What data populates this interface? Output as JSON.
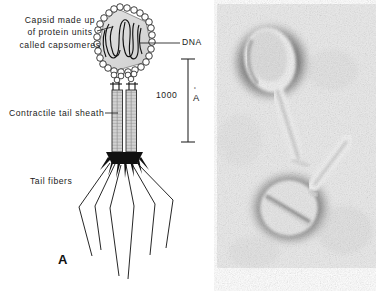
{
  "figure": {
    "background_color": "#ffffff"
  },
  "panel_a": {
    "letter": "A",
    "type": "labeled-line-diagram",
    "subject": "bacteriophage (T-even phage) schematic",
    "colors": {
      "outline": "#1a1a1a",
      "capsid_fill": "#d9d9d9",
      "sheath_fill": "#cccccc",
      "baseplate": "#111111"
    },
    "labels": [
      {
        "name": "capsid",
        "lines": [
          "Capsid made up",
          "of protein units",
          "called capsomeres"
        ],
        "text": "Capsid made up of protein units called capsomeres",
        "leader": "right"
      },
      {
        "name": "dna",
        "lines": [
          "DNA"
        ],
        "text": "DNA",
        "leader": "left"
      },
      {
        "name": "contractile-tail-sheath",
        "lines": [
          "Contractile tail sheath"
        ],
        "text": "Contractile tail sheath",
        "leader": "right"
      },
      {
        "name": "tail-fibers",
        "lines": [
          "Tail fibers"
        ],
        "text": "Tail fibers",
        "leader": "none"
      }
    ],
    "scale_bar": {
      "value": "1000",
      "unit": "A",
      "unit_mark": "˚",
      "unit_display": "Å",
      "orientation": "vertical",
      "caps": "serif-ends"
    }
  },
  "panel_b": {
    "letter": "B",
    "type": "electron-micrograph",
    "subject": "two negatively stained bacteriophage particles",
    "colors": {
      "background": "#e8e8e8",
      "stain_dark": "#3a3a3a",
      "particle_light": "#f2f2f2"
    }
  }
}
